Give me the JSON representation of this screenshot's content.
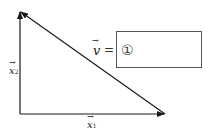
{
  "diagram": {
    "vectors": [
      {
        "name": "x1",
        "label": "x",
        "subscript": "1",
        "from": [
          20,
          114
        ],
        "to": [
          165,
          114
        ]
      },
      {
        "name": "x2",
        "label": "x",
        "subscript": "2",
        "from": [
          20,
          114
        ],
        "to": [
          20,
          11
        ]
      },
      {
        "name": "v",
        "label": "v",
        "from": [
          165,
          114
        ],
        "to": [
          20,
          11
        ]
      }
    ],
    "equation": {
      "lhs": "v",
      "equals": "=",
      "blank_marker": "①"
    },
    "colors": {
      "stroke": "#1a1a1a",
      "box_border": "#555555"
    }
  }
}
